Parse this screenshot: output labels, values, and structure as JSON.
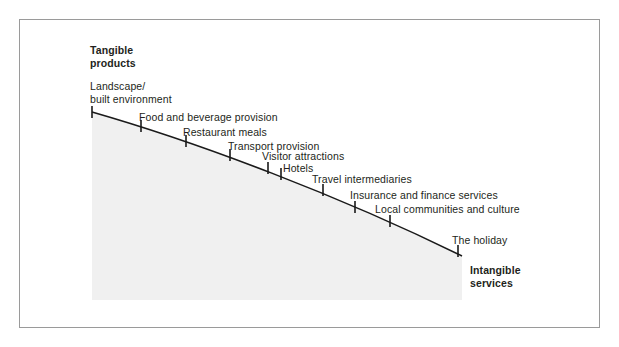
{
  "figure": {
    "type": "tangible-intangible-continuum-diagram",
    "pole_top": "Tangible\nproducts",
    "pole_bottom": "Intangible\nservices",
    "shade_color": "#f0f0f0",
    "line_color": "#1a1a1a",
    "frame_color": "#9a9a9a"
  },
  "chart_data": {
    "type": "line",
    "title": "",
    "subtitle": "",
    "xlabel": "",
    "ylabel": "",
    "grid": false,
    "legend": "none",
    "axis_poles": {
      "start": "Tangible products",
      "end": "Intangible services"
    },
    "categories": [
      "Landscape/ built environment",
      "Food and beverage provision",
      "Restaurant meals",
      "Transport provision",
      "Visitor attractions",
      "Hotels",
      "Travel intermediaries",
      "Insurance and finance services",
      "Local communities and culture",
      "The holiday"
    ],
    "points": [
      {
        "label": "Landscape/\nbuilt environment",
        "x": 92,
        "y": 112,
        "label_x": 90,
        "label_y": 80,
        "tangibility_rank": 1
      },
      {
        "label": "Food and beverage provision",
        "x": 141,
        "y": 126,
        "label_x": 139,
        "label_y": 111,
        "tangibility_rank": 2
      },
      {
        "label": "Restaurant meals",
        "x": 186,
        "y": 141,
        "label_x": 183,
        "label_y": 126,
        "tangibility_rank": 3
      },
      {
        "label": "Transport provision",
        "x": 230,
        "y": 155,
        "label_x": 228,
        "label_y": 140,
        "tangibility_rank": 4
      },
      {
        "label": "Visitor attractions",
        "x": 268,
        "y": 168,
        "label_x": 262,
        "label_y": 150,
        "tangibility_rank": 5
      },
      {
        "label": "Hotels",
        "x": 281,
        "y": 174,
        "label_x": 283,
        "label_y": 162,
        "tangibility_rank": 6
      },
      {
        "label": "Travel intermediaries",
        "x": 323,
        "y": 190,
        "label_x": 312,
        "label_y": 173,
        "tangibility_rank": 7
      },
      {
        "label": "Insurance and finance services",
        "x": 355,
        "y": 207,
        "label_x": 350,
        "label_y": 189,
        "tangibility_rank": 8
      },
      {
        "label": "Local communities and culture",
        "x": 390,
        "y": 221,
        "label_x": 375,
        "label_y": 203,
        "tangibility_rank": 9
      },
      {
        "label": "The holiday",
        "x": 458,
        "y": 251,
        "label_x": 452,
        "label_y": 234,
        "tangibility_rank": 10
      }
    ],
    "curve": "M 92 112 C 200 143, 340 196, 462 256",
    "shaded_area": {
      "left": 92,
      "top": 112,
      "right": 462,
      "bottom": 300
    }
  }
}
